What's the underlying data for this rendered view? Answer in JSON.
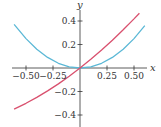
{
  "chart_data": {
    "type": "line",
    "title": "",
    "xlabel": "x",
    "ylabel": "y",
    "xlim": [
      -0.62,
      0.6
    ],
    "ylim": [
      -0.42,
      0.48
    ],
    "grid": false,
    "legend": null,
    "x_ticks": [
      {
        "value": -0.5,
        "label": "−0.50"
      },
      {
        "value": -0.25,
        "label": "−0.25"
      },
      {
        "value": 0.25,
        "label": "0.25"
      },
      {
        "value": 0.5,
        "label": "0.50"
      }
    ],
    "y_ticks": [
      {
        "value": 0.4,
        "label": "0.4"
      },
      {
        "value": 0.2,
        "label": "0.2"
      },
      {
        "value": -0.2,
        "label": "−0.2"
      },
      {
        "value": -0.4,
        "label": "−0.4"
      }
    ],
    "series": [
      {
        "name": "blue curve (parabola)",
        "color": "#5bb8d6",
        "x": [
          -0.61,
          -0.5,
          -0.4,
          -0.3,
          -0.2,
          -0.1,
          0,
          0.1,
          0.2,
          0.3,
          0.4,
          0.5,
          0.6
        ],
        "values": [
          0.372,
          0.25,
          0.16,
          0.09,
          0.04,
          0.01,
          0,
          0.01,
          0.04,
          0.09,
          0.16,
          0.25,
          0.36
        ]
      },
      {
        "name": "red curve",
        "color": "#d9506e",
        "x": [
          -0.61,
          -0.5,
          -0.4,
          -0.3,
          -0.2,
          -0.1,
          0,
          0.1,
          0.2,
          0.3,
          0.4,
          0.5,
          0.55
        ],
        "values": [
          -0.35,
          -0.3,
          -0.25,
          -0.195,
          -0.135,
          -0.07,
          0,
          0.074,
          0.153,
          0.237,
          0.325,
          0.418,
          0.466
        ]
      }
    ]
  },
  "axes": {
    "x_label": "x",
    "y_label": "y"
  }
}
